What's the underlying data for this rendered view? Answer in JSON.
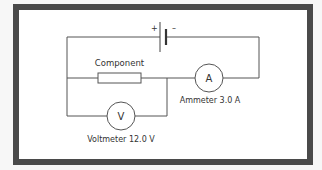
{
  "diagram": {
    "type": "circuit",
    "battery": {
      "positive_label": "+",
      "negative_label": "–"
    },
    "component": {
      "label": "Component"
    },
    "ammeter": {
      "symbol": "A",
      "label": "Ammeter 3.0 A",
      "reading": "3.0 A"
    },
    "voltmeter": {
      "symbol": "V",
      "label": "Voltmeter 12.0 V",
      "reading": "12.0 V"
    }
  },
  "colors": {
    "frame": "#4a4a4a",
    "wire": "#555555",
    "text": "#333333",
    "background": "#ffffff"
  }
}
